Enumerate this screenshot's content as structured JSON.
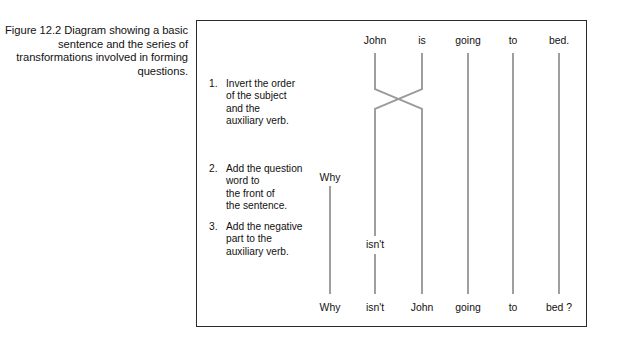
{
  "caption": {
    "text": "Figure 12.2 Diagram showing a basic sentence and the series of transformations involved in forming questions."
  },
  "diagram": {
    "steps": [
      {
        "number": "1.",
        "lines": [
          "Invert the order",
          "of the subject",
          "and the",
          "auxiliary verb."
        ]
      },
      {
        "number": "2.",
        "lines": [
          "Add the question",
          "word to",
          "the front of",
          "the sentence."
        ]
      },
      {
        "number": "3.",
        "lines": [
          "Add the negative",
          "part to the",
          "auxiliary verb."
        ]
      }
    ],
    "top_row": [
      {
        "label": "John",
        "x": 374
      },
      {
        "label": "is",
        "x": 421
      },
      {
        "label": "going",
        "x": 467
      },
      {
        "label": "to",
        "x": 512
      },
      {
        "label": "bed.",
        "x": 558
      }
    ],
    "mid_labels": [
      {
        "label": "Why",
        "x": 329,
        "y": 173
      },
      {
        "label": "isn't",
        "x": 374,
        "y": 243
      }
    ],
    "bottom_row": [
      {
        "label": "Why",
        "x": 329
      },
      {
        "label": "isn't",
        "x": 374
      },
      {
        "label": "John",
        "x": 421
      },
      {
        "label": "going",
        "x": 467
      },
      {
        "label": "to",
        "x": 512
      },
      {
        "label": "bed ?",
        "x": 558
      }
    ],
    "colors": {
      "line": "#9a9a9a",
      "border": "#2b2b2b",
      "text": "#111111",
      "background": "#ffffff"
    }
  }
}
